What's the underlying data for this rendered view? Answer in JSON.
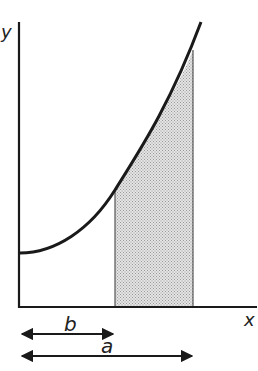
{
  "diagram": {
    "axis_labels": {
      "y": "y",
      "x": "x"
    },
    "dimension_labels": {
      "b": "b",
      "a": "a"
    },
    "colors": {
      "stroke": "#1a1a1a",
      "shade": "#d4d4d4"
    }
  }
}
